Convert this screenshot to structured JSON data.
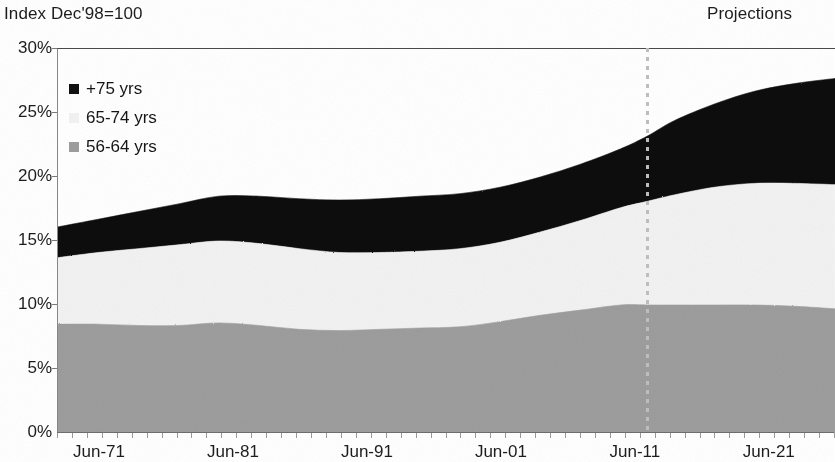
{
  "header": {
    "index_note": "Index Dec'98=100",
    "projections_note": "Projections"
  },
  "legend": {
    "position": "inside-top-left",
    "items": [
      {
        "label": "+75 yrs",
        "swatch": "legend-swatch-black",
        "color": "#111111"
      },
      {
        "label": "65-74 yrs",
        "swatch": "legend-swatch-white",
        "color": "#f2f2f2"
      },
      {
        "label": "56-64 yrs",
        "swatch": "legend-swatch-gray",
        "color": "#9d9d9d"
      }
    ]
  },
  "axes": {
    "y_ticks": [
      "0%",
      "5%",
      "10%",
      "15%",
      "20%",
      "25%",
      "30%"
    ],
    "x_ticks": [
      "Jun-71",
      "Jun-81",
      "Jun-91",
      "Jun-01",
      "Jun-11",
      "Jun-21"
    ]
  },
  "chart_data": {
    "type": "area",
    "title": "Index Dec'98=100",
    "subtitle": "",
    "xlabel": "",
    "ylabel": "",
    "stacked": true,
    "grid": false,
    "legend_position": "inside-top-left",
    "ylim": [
      0,
      30
    ],
    "ytick_values": [
      0,
      5,
      10,
      15,
      20,
      25,
      30
    ],
    "ytick_labels": [
      "0%",
      "5%",
      "10%",
      "15%",
      "20%",
      "25%",
      "30%"
    ],
    "xlim": [
      "Jun-71",
      "Jun-29"
    ],
    "xtick_labels": [
      "Jun-71",
      "Jun-81",
      "Jun-91",
      "Jun-01",
      "Jun-11",
      "Jun-21"
    ],
    "xtick_positions": [
      1971,
      1981,
      1991,
      2001,
      2011,
      2021
    ],
    "annotations": [
      {
        "text": "Projections",
        "x": 2014.5,
        "y": 30,
        "note": "label above plot, right of divider"
      },
      {
        "type": "vline",
        "style": "dotted",
        "x": 2015.0,
        "color": "#bfbfbf",
        "note": "actual vs projection divider"
      }
    ],
    "x": [
      1971,
      1974,
      1977,
      1980,
      1983,
      1986,
      1989,
      1992,
      1995,
      1998,
      2001,
      2004,
      2007,
      2010,
      2013,
      2015,
      2017,
      2020,
      2023,
      2026,
      2029
    ],
    "series": [
      {
        "name": "56-64 yrs",
        "color": "#9d9d9d",
        "values": [
          8.5,
          8.5,
          8.4,
          8.4,
          8.6,
          8.4,
          8.1,
          8.0,
          8.1,
          8.2,
          8.3,
          8.7,
          9.2,
          9.6,
          10.0,
          10.0,
          10.0,
          10.0,
          10.0,
          9.9,
          9.7
        ]
      },
      {
        "name": "65-74 yrs",
        "color": "#f2f2f2",
        "values": [
          5.2,
          5.6,
          6.0,
          6.3,
          6.4,
          6.4,
          6.3,
          6.1,
          6.0,
          6.0,
          6.1,
          6.2,
          6.5,
          7.0,
          7.6,
          8.1,
          8.6,
          9.2,
          9.5,
          9.6,
          9.7
        ]
      },
      {
        "name": "+75 yrs",
        "color": "#111111",
        "values": [
          2.4,
          2.6,
          2.9,
          3.2,
          3.5,
          3.7,
          3.9,
          4.1,
          4.2,
          4.3,
          4.3,
          4.3,
          4.3,
          4.4,
          4.6,
          5.1,
          5.8,
          6.5,
          7.2,
          7.8,
          8.3
        ]
      }
    ],
    "totals_note": "Top of stack rises from about 16% in Jun-71 to about 28% at the right edge"
  }
}
